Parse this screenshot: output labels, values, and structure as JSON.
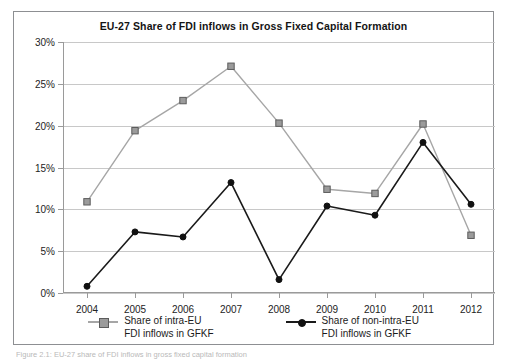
{
  "figure": {
    "caption": "Figure 2.1:  EU-27 share of FDI inflows in gross fixed capital formation"
  },
  "chart_data": {
    "type": "line",
    "title": "EU-27 Share of FDI inflows in Gross Fixed Capital Formation",
    "xlabel": "",
    "ylabel": "",
    "categories": [
      "2004",
      "2005",
      "2006",
      "2007",
      "2008",
      "2009",
      "2010",
      "2011",
      "2012"
    ],
    "series": [
      {
        "name": "Share of intra-EU FDI inflows in GFKF",
        "legend_line1": "Share of intra-EU",
        "legend_line2": "FDI inflows in GFKF",
        "color": "#a6a6a6",
        "marker": "square",
        "marker_fill": "#9b9b9b",
        "marker_edge": "#5c5c5c",
        "values": [
          10.9,
          19.4,
          23.0,
          27.1,
          20.3,
          12.4,
          11.9,
          20.2,
          6.9
        ]
      },
      {
        "name": "Share of non-intra-EU FDI inflows in GFKF",
        "legend_line1": "Share of non-intra-EU",
        "legend_line2": "FDI inflows in GFKF",
        "color": "#1a1a1a",
        "marker": "circle",
        "marker_fill": "#111111",
        "marker_edge": "#111111",
        "values": [
          0.8,
          7.3,
          6.7,
          13.2,
          1.6,
          10.4,
          9.3,
          18.0,
          10.6
        ]
      }
    ],
    "ylim": [
      0,
      30
    ],
    "ytick_values": [
      0,
      5,
      10,
      15,
      20,
      25,
      30
    ],
    "ytick_labels": [
      "0%",
      "5%",
      "10%",
      "15%",
      "20%",
      "25%",
      "30%"
    ],
    "grid": "horizontal",
    "gridline_color": "#c8c8c8",
    "legend_position": "bottom"
  }
}
